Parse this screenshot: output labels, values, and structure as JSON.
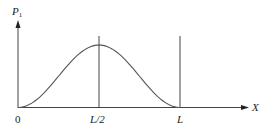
{
  "chart_data": {
    "type": "line",
    "title": "",
    "xlabel": "X",
    "ylabel": "P",
    "ylabel_subscript": "1",
    "x_ticks": [
      "0",
      "L/2",
      "L"
    ],
    "x_tick_positions": [
      0,
      0.5,
      1.0
    ],
    "xlim": [
      0,
      1.35
    ],
    "ylim": [
      0,
      1.35
    ],
    "grid": false,
    "legend": null,
    "series": [
      {
        "name": "P1(x) ∝ sin²(πx/L)",
        "x": [
          0,
          0.125,
          0.25,
          0.375,
          0.5,
          0.625,
          0.75,
          0.875,
          1.0
        ],
        "values": [
          0,
          0.146,
          0.5,
          0.854,
          1.0,
          0.854,
          0.5,
          0.146,
          0
        ]
      }
    ],
    "annotations": [
      {
        "type": "vertical-line",
        "x": 0.5,
        "label": "L/2"
      },
      {
        "type": "vertical-line",
        "x": 1.0,
        "label": "L"
      }
    ]
  },
  "labels": {
    "ylabel_main": "P",
    "ylabel_sub": "1",
    "xlabel": "X",
    "tick_0": "0",
    "tick_half": "L/2",
    "tick_L": "L"
  },
  "colors": {
    "axis": "#333333",
    "curve": "#555555",
    "background": "#ffffff"
  }
}
